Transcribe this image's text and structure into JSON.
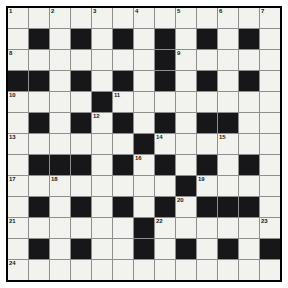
{
  "puzzle": {
    "type": "crossword-grid",
    "title": "Crossword Puzzle Grid",
    "rows": 13,
    "columns": 13,
    "cell_size_px": 20,
    "colors": {
      "white_cell": "#f2f2ee",
      "black_cell": "#17171a",
      "grid_line": "#8e8e8e",
      "border": "#000000",
      "number_text": "#1a1a1a",
      "page_background": "#ffffff"
    },
    "legend": {
      "black_value": 1,
      "white_value": 0
    },
    "grid": [
      [
        0,
        0,
        0,
        0,
        0,
        0,
        0,
        0,
        0,
        0,
        0,
        0,
        0
      ],
      [
        0,
        1,
        0,
        1,
        0,
        1,
        0,
        1,
        0,
        1,
        0,
        1,
        0
      ],
      [
        0,
        0,
        0,
        0,
        0,
        0,
        0,
        1,
        0,
        0,
        0,
        0,
        0
      ],
      [
        1,
        1,
        0,
        1,
        0,
        1,
        0,
        1,
        0,
        1,
        0,
        1,
        0
      ],
      [
        0,
        0,
        0,
        0,
        1,
        0,
        0,
        0,
        0,
        0,
        0,
        0,
        0
      ],
      [
        0,
        1,
        0,
        1,
        0,
        1,
        0,
        1,
        0,
        1,
        1,
        0,
        0
      ],
      [
        0,
        0,
        0,
        0,
        0,
        0,
        1,
        0,
        0,
        0,
        0,
        0,
        0
      ],
      [
        0,
        1,
        1,
        1,
        0,
        1,
        0,
        1,
        0,
        1,
        0,
        1,
        0
      ],
      [
        0,
        0,
        0,
        0,
        0,
        0,
        0,
        0,
        1,
        0,
        0,
        0,
        0
      ],
      [
        0,
        1,
        0,
        1,
        0,
        1,
        0,
        1,
        0,
        1,
        1,
        1,
        0
      ],
      [
        0,
        0,
        0,
        0,
        0,
        0,
        1,
        0,
        0,
        0,
        0,
        0,
        0
      ],
      [
        0,
        1,
        0,
        1,
        0,
        0,
        1,
        0,
        1,
        0,
        1,
        0,
        1
      ],
      [
        0,
        0,
        0,
        0,
        0,
        0,
        0,
        0,
        0,
        0,
        0,
        0,
        0
      ]
    ],
    "numbers": [
      {
        "n": 1,
        "row": 0,
        "col": 0
      },
      {
        "n": 2,
        "row": 0,
        "col": 2
      },
      {
        "n": 3,
        "row": 0,
        "col": 4
      },
      {
        "n": 4,
        "row": 0,
        "col": 6
      },
      {
        "n": 5,
        "row": 0,
        "col": 8
      },
      {
        "n": 6,
        "row": 0,
        "col": 10
      },
      {
        "n": 7,
        "row": 0,
        "col": 12
      },
      {
        "n": 8,
        "row": 2,
        "col": 0
      },
      {
        "n": 9,
        "row": 2,
        "col": 8
      },
      {
        "n": 10,
        "row": 4,
        "col": 0
      },
      {
        "n": 11,
        "row": 4,
        "col": 5
      },
      {
        "n": 12,
        "row": 5,
        "col": 4
      },
      {
        "n": 13,
        "row": 6,
        "col": 0
      },
      {
        "n": 14,
        "row": 6,
        "col": 7
      },
      {
        "n": 15,
        "row": 6,
        "col": 10
      },
      {
        "n": 16,
        "row": 7,
        "col": 6
      },
      {
        "n": 17,
        "row": 8,
        "col": 0
      },
      {
        "n": 18,
        "row": 8,
        "col": 2
      },
      {
        "n": 19,
        "row": 8,
        "col": 9
      },
      {
        "n": 20,
        "row": 9,
        "col": 8
      },
      {
        "n": 21,
        "row": 10,
        "col": 0
      },
      {
        "n": 22,
        "row": 10,
        "col": 7
      },
      {
        "n": 23,
        "row": 10,
        "col": 12
      },
      {
        "n": 24,
        "row": 12,
        "col": 0
      }
    ]
  }
}
